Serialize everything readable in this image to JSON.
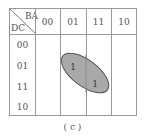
{
  "kmap": {
    "corner": {
      "col_var": "BA",
      "row_var": "DC"
    },
    "col_headers": [
      "00",
      "01",
      "11",
      "10"
    ],
    "row_headers": [
      "00",
      "01",
      "11",
      "10"
    ],
    "cells": [
      [
        "",
        "",
        "",
        ""
      ],
      [
        "",
        "1",
        "",
        ""
      ],
      [
        "",
        "",
        "1",
        ""
      ],
      [
        "",
        "",
        "",
        ""
      ]
    ],
    "group": {
      "fill": "#a9a9a9",
      "stroke": "#555555",
      "covers": [
        "DC=01,BA=01",
        "DC=11,BA=11"
      ]
    }
  },
  "caption": "( c )"
}
